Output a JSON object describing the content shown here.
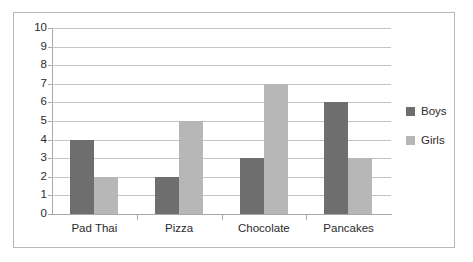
{
  "chart_data": {
    "type": "bar",
    "title": "",
    "subtitle": "",
    "xlabel": "",
    "ylabel": "",
    "categories": [
      "Pad Thai",
      "Pizza",
      "Chocolate",
      "Pancakes"
    ],
    "series": [
      {
        "name": "Boys",
        "values": [
          4,
          2,
          3,
          6
        ],
        "color": "#6e6e6e"
      },
      {
        "name": "Girls",
        "values": [
          2,
          5,
          7,
          3
        ],
        "color": "#b7b7b7"
      }
    ],
    "ylim": [
      0,
      10
    ],
    "ytick_labels": [
      "10",
      "9",
      "8",
      "7",
      "6",
      "5",
      "4",
      "3",
      "2",
      "1",
      "0"
    ],
    "ytick_values": [
      10,
      9,
      8,
      7,
      6,
      5,
      4,
      3,
      2,
      1,
      0
    ],
    "grid": true,
    "grid_axis": "y",
    "legend": true,
    "legend_position": "right",
    "legend_entries": [
      "Boys",
      "Girls"
    ],
    "bar_layout": "grouped",
    "frame_color": "#b9b9b9",
    "gridline_color": "#c3c3c3",
    "axis_color": "#a8a8a8",
    "background": "#ffffff"
  }
}
